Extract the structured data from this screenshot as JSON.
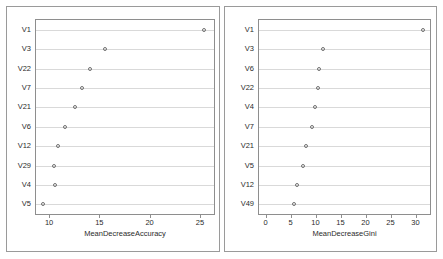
{
  "figure": {
    "background": "#ffffff",
    "frame_color": "#9a9a9a",
    "axis_color": "#8e8e8e",
    "grid_color": "#d9d9d9",
    "point_color": "#707070",
    "text_color": "#2b2b2b"
  },
  "chart_data": [
    {
      "type": "scatter",
      "panel": "left",
      "title": "",
      "xlabel": "MeanDecreaseAccuracy",
      "ylabel": "",
      "categories": [
        "V1",
        "V3",
        "V22",
        "V7",
        "V21",
        "V6",
        "V12",
        "V29",
        "V4",
        "V5"
      ],
      "values": [
        25.4,
        15.6,
        14.1,
        13.3,
        12.6,
        11.6,
        10.9,
        10.5,
        10.6,
        9.4
      ],
      "xticks": [
        10,
        15,
        20,
        25
      ],
      "xlim": [
        8.7,
        26.4
      ],
      "grid": true,
      "legend": "none"
    },
    {
      "type": "scatter",
      "panel": "right",
      "title": "",
      "xlabel": "MeanDecreaseGini",
      "ylabel": "",
      "categories": [
        "V1",
        "V3",
        "V6",
        "V22",
        "V4",
        "V7",
        "V21",
        "V5",
        "V12",
        "V49"
      ],
      "values": [
        31.4,
        11.4,
        10.6,
        10.4,
        9.9,
        9.2,
        8.1,
        7.4,
        6.2,
        5.6
      ],
      "xticks": [
        0,
        5,
        10,
        15,
        20,
        25,
        30
      ],
      "xlim": [
        -1.3,
        32.9
      ],
      "grid": true,
      "legend": "none"
    }
  ]
}
